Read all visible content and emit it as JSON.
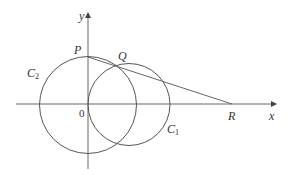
{
  "diagram": {
    "stroke_color": "#555555",
    "axes": {
      "x_label": "x",
      "y_label": "y",
      "origin_label": "0"
    },
    "points": {
      "P": {
        "label": "P"
      },
      "Q": {
        "label": "Q"
      },
      "R": {
        "label": "R"
      }
    },
    "circles": {
      "C1": {
        "label": "C",
        "subscript": "1"
      },
      "C2": {
        "label": "C",
        "subscript": "2"
      }
    }
  }
}
